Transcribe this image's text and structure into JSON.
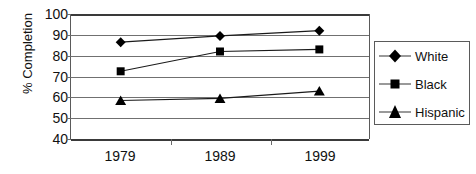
{
  "chart_data": {
    "type": "line",
    "title": "",
    "xlabel": "",
    "ylabel": "% Completion",
    "categories": [
      "1979",
      "1989",
      "1999"
    ],
    "ylim": [
      40,
      100
    ],
    "ytick_step": 10,
    "yticks": [
      "100",
      "90",
      "80",
      "70",
      "60",
      "50",
      "40"
    ],
    "grid": true,
    "legend_position": "right",
    "series": [
      {
        "name": "White",
        "marker": "diamond",
        "values": [
          86.5,
          89.5,
          92.0
        ]
      },
      {
        "name": "Black",
        "marker": "square",
        "values": [
          72.5,
          82.0,
          83.0
        ]
      },
      {
        "name": "Hispanic",
        "marker": "triangle",
        "values": [
          58.5,
          59.5,
          63.0
        ]
      }
    ]
  },
  "legend": {
    "items": [
      {
        "label": "White",
        "marker": "diamond-marker-icon"
      },
      {
        "label": "Black",
        "marker": "square-marker-icon"
      },
      {
        "label": "Hispanic",
        "marker": "triangle-marker-icon"
      }
    ]
  },
  "caption": {
    "text": ""
  },
  "colors": {
    "line": "#1a1a1a",
    "marker": "#000000",
    "grid": "#707070",
    "axis": "#3a3a3a",
    "text": "#111111",
    "background": "#ffffff"
  }
}
